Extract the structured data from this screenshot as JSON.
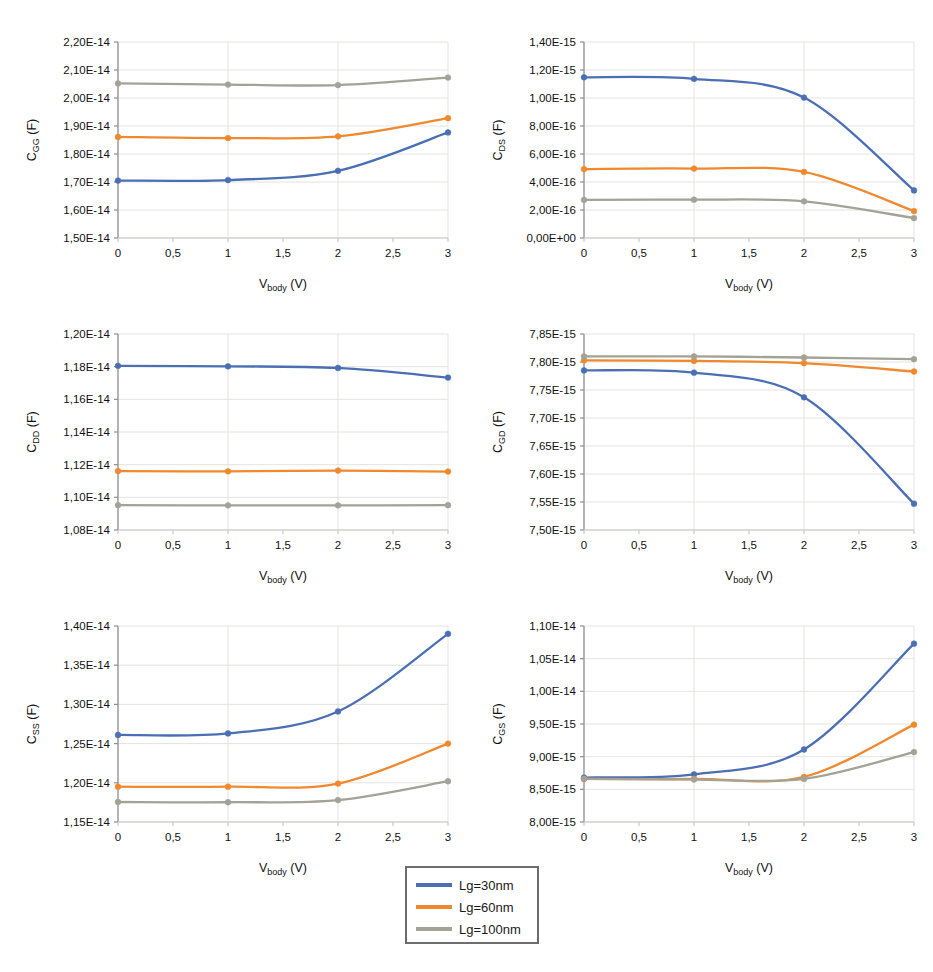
{
  "figure": {
    "width": 933,
    "height": 972,
    "background": "#ffffff"
  },
  "series_colors": {
    "Lg=30nm": "#4a6fb5",
    "Lg=60nm": "#f0882e",
    "Lg=100nm": "#a3a297"
  },
  "legend": {
    "position": "bottom-center",
    "border_color": "#6d6d6d",
    "items": [
      {
        "label": "Lg=30nm",
        "color": "#4a6fb5"
      },
      {
        "label": "Lg=60nm",
        "color": "#f0882e"
      },
      {
        "label": "Lg=100nm",
        "color": "#a3a297"
      }
    ]
  },
  "shared": {
    "xlabel_main": "V",
    "xlabel_sub": "body",
    "xlabel_unit": " (V)",
    "x": [
      0,
      1,
      2,
      3
    ],
    "xticks": [
      0,
      0.5,
      1,
      1.5,
      2,
      2.5,
      3
    ],
    "xticklabels": [
      "0",
      "0,5",
      "1",
      "1,5",
      "2",
      "2,5",
      "3"
    ],
    "xlim": [
      0,
      3
    ],
    "grid": true,
    "marker": "circle"
  },
  "chart_data": [
    {
      "id": "cgg",
      "type": "line",
      "title": "",
      "ylabel_main": "C",
      "ylabel_sub": "GG",
      "ylabel_unit": " (F)",
      "xlabel": "Vbody (V)",
      "ylim": [
        1.5e-14,
        2.2e-14
      ],
      "yticks": [
        1.5e-14,
        1.6e-14,
        1.7e-14,
        1.8e-14,
        1.9e-14,
        2e-14,
        2.1e-14,
        2.2e-14
      ],
      "yticklabels": [
        "1,50E-14",
        "1,60E-14",
        "1,70E-14",
        "1,80E-14",
        "1,90E-14",
        "2,00E-14",
        "2,10E-14",
        "2,20E-14"
      ],
      "categories": [
        0,
        1,
        2,
        3
      ],
      "series": [
        {
          "name": "Lg=30nm",
          "color": "#4a6fb5",
          "values": [
            1.705e-14,
            1.707e-14,
            1.74e-14,
            1.877e-14
          ]
        },
        {
          "name": "Lg=60nm",
          "color": "#f0882e",
          "values": [
            1.861e-14,
            1.857e-14,
            1.863e-14,
            1.928e-14
          ]
        },
        {
          "name": "Lg=100nm",
          "color": "#a3a297",
          "values": [
            2.052e-14,
            2.048e-14,
            2.046e-14,
            2.073e-14
          ]
        }
      ]
    },
    {
      "id": "cds",
      "type": "line",
      "title": "",
      "ylabel_main": "C",
      "ylabel_sub": "DS",
      "ylabel_unit": " (F)",
      "xlabel": "Vbody (V)",
      "ylim": [
        0.0,
        1.4e-15
      ],
      "yticks": [
        0.0,
        2e-16,
        4e-16,
        6e-16,
        8e-16,
        1e-15,
        1.2e-15,
        1.4e-15
      ],
      "yticklabels": [
        "0,00E+00",
        "2,00E-16",
        "4,00E-16",
        "6,00E-16",
        "8,00E-16",
        "1,00E-15",
        "1,20E-15",
        "1,40E-15"
      ],
      "categories": [
        0,
        1,
        2,
        3
      ],
      "series": [
        {
          "name": "Lg=30nm",
          "color": "#4a6fb5",
          "values": [
            1.148e-15,
            1.137e-15,
            1.003e-15,
            3.4e-16
          ]
        },
        {
          "name": "Lg=60nm",
          "color": "#f0882e",
          "values": [
            4.92e-16,
            4.96e-16,
            4.72e-16,
            1.92e-16
          ]
        },
        {
          "name": "Lg=100nm",
          "color": "#a3a297",
          "values": [
            2.72e-16,
            2.74e-16,
            2.62e-16,
            1.42e-16
          ]
        }
      ]
    },
    {
      "id": "cdd",
      "type": "line",
      "title": "",
      "ylabel_main": "C",
      "ylabel_sub": "DD",
      "ylabel_unit": " (F)",
      "xlabel": "Vbody (V)",
      "ylim": [
        1.08e-14,
        1.2e-14
      ],
      "yticks": [
        1.08e-14,
        1.1e-14,
        1.12e-14,
        1.14e-14,
        1.16e-14,
        1.18e-14,
        1.2e-14
      ],
      "yticklabels": [
        "1,08E-14",
        "1,10E-14",
        "1,12E-14",
        "1,14E-14",
        "1,16E-14",
        "1,18E-14",
        "1,20E-14"
      ],
      "categories": [
        0,
        1,
        2,
        3
      ],
      "series": [
        {
          "name": "Lg=30nm",
          "color": "#4a6fb5",
          "values": [
            1.1805e-14,
            1.1802e-14,
            1.1792e-14,
            1.1733e-14
          ]
        },
        {
          "name": "Lg=60nm",
          "color": "#f0882e",
          "values": [
            1.1161e-14,
            1.1159e-14,
            1.1164e-14,
            1.1158e-14
          ]
        },
        {
          "name": "Lg=100nm",
          "color": "#a3a297",
          "values": [
            1.0952e-14,
            1.0951e-14,
            1.0951e-14,
            1.0952e-14
          ]
        }
      ]
    },
    {
      "id": "cgd",
      "type": "line",
      "title": "",
      "ylabel_main": "C",
      "ylabel_sub": "GD",
      "ylabel_unit": " (F)",
      "xlabel": "Vbody (V)",
      "ylim": [
        7.5e-15,
        7.85e-15
      ],
      "yticks": [
        7.5e-15,
        7.55e-15,
        7.6e-15,
        7.65e-15,
        7.7e-15,
        7.75e-15,
        7.8e-15,
        7.85e-15
      ],
      "yticklabels": [
        "7,50E-15",
        "7,55E-15",
        "7,60E-15",
        "7,65E-15",
        "7,70E-15",
        "7,75E-15",
        "7,80E-15",
        "7,85E-15"
      ],
      "categories": [
        0,
        1,
        2,
        3
      ],
      "series": [
        {
          "name": "Lg=30nm",
          "color": "#4a6fb5",
          "values": [
            7.785e-15,
            7.781e-15,
            7.737e-15,
            7.547e-15
          ]
        },
        {
          "name": "Lg=60nm",
          "color": "#f0882e",
          "values": [
            7.803e-15,
            7.802e-15,
            7.798e-15,
            7.783e-15
          ]
        },
        {
          "name": "Lg=100nm",
          "color": "#a3a297",
          "values": [
            7.81e-15,
            7.81e-15,
            7.808e-15,
            7.805e-15
          ]
        }
      ]
    },
    {
      "id": "css",
      "type": "line",
      "title": "",
      "ylabel_main": "C",
      "ylabel_sub": "SS",
      "ylabel_unit": " (F)",
      "xlabel": "Vbody (V)",
      "ylim": [
        1.15e-14,
        1.4e-14
      ],
      "yticks": [
        1.15e-14,
        1.2e-14,
        1.25e-14,
        1.3e-14,
        1.35e-14,
        1.4e-14
      ],
      "yticklabels": [
        "1,15E-14",
        "1,20E-14",
        "1,25E-14",
        "1,30E-14",
        "1,35E-14",
        "1,40E-14"
      ],
      "categories": [
        0,
        1,
        2,
        3
      ],
      "series": [
        {
          "name": "Lg=30nm",
          "color": "#4a6fb5",
          "values": [
            1.261e-14,
            1.263e-14,
            1.291e-14,
            1.39e-14
          ]
        },
        {
          "name": "Lg=60nm",
          "color": "#f0882e",
          "values": [
            1.195e-14,
            1.195e-14,
            1.199e-14,
            1.25e-14
          ]
        },
        {
          "name": "Lg=100nm",
          "color": "#a3a297",
          "values": [
            1.1755e-14,
            1.1752e-14,
            1.178e-14,
            1.202e-14
          ]
        }
      ]
    },
    {
      "id": "cgs",
      "type": "line",
      "title": "",
      "ylabel_main": "C",
      "ylabel_sub": "GS",
      "ylabel_unit": " (F)",
      "xlabel": "Vbody (V)",
      "ylim": [
        8e-15,
        1.1e-14
      ],
      "yticks": [
        8e-15,
        8.5e-15,
        9e-15,
        9.5e-15,
        1e-14,
        1.05e-14,
        1.1e-14
      ],
      "yticklabels": [
        "8,00E-15",
        "8,50E-15",
        "9,00E-15",
        "9,50E-15",
        "1,00E-14",
        "1,05E-14",
        "1,10E-14"
      ],
      "categories": [
        0,
        1,
        2,
        3
      ],
      "series": [
        {
          "name": "Lg=30nm",
          "color": "#4a6fb5",
          "values": [
            8.68e-15,
            8.73e-15,
            9.11e-15,
            1.073e-14
          ]
        },
        {
          "name": "Lg=60nm",
          "color": "#f0882e",
          "values": [
            8.66e-15,
            8.66e-15,
            8.69e-15,
            9.49e-15
          ]
        },
        {
          "name": "Lg=100nm",
          "color": "#a3a297",
          "values": [
            8.66e-15,
            8.65e-15,
            8.66e-15,
            9.07e-15
          ]
        }
      ]
    }
  ],
  "panel_layout": [
    {
      "id": "cgg",
      "left": 0,
      "top": 20
    },
    {
      "id": "cds",
      "left": 466,
      "top": 20
    },
    {
      "id": "cdd",
      "left": 0,
      "top": 312
    },
    {
      "id": "cgd",
      "left": 466,
      "top": 312
    },
    {
      "id": "css",
      "left": 0,
      "top": 604
    },
    {
      "id": "cgs",
      "left": 466,
      "top": 604
    }
  ]
}
